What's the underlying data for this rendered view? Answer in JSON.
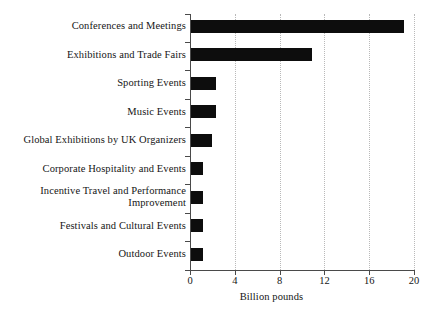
{
  "chart_data": {
    "type": "bar",
    "orientation": "horizontal",
    "title": "",
    "subtitle": "",
    "xlabel": "Billion pounds",
    "ylabel": "",
    "xlim": [
      0,
      20
    ],
    "xticks": [
      0,
      4,
      8,
      12,
      16,
      20
    ],
    "xtick_labels": [
      "0",
      "4",
      "8",
      "12",
      "16",
      "20"
    ],
    "grid": "vertical-dotted",
    "legend": "none",
    "bar_color": "#0d0d0d",
    "axis_color": "#4a4a4a",
    "grid_color": "#b9b9b9",
    "background": "#ffffff",
    "categories": [
      "Conferences and Meetings",
      "Exhibitions and Trade Fairs",
      "Sporting Events",
      "Music Events",
      "Global Exhibitions by UK Organizers",
      "Corporate Hospitality and Events",
      "Incentive Travel and Performance\nImprovement",
      "Festivals and Cultural Events",
      "Outdoor Events"
    ],
    "values": [
      19.1,
      10.9,
      2.3,
      2.3,
      2.0,
      1.2,
      1.2,
      1.2,
      1.2
    ],
    "series": [
      {
        "name": "Billion pounds",
        "values": [
          19.1,
          10.9,
          2.3,
          2.3,
          2.0,
          1.2,
          1.2,
          1.2,
          1.2
        ]
      }
    ]
  }
}
